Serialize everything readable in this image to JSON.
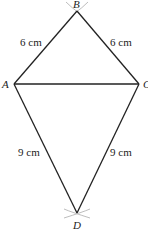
{
  "diagram": {
    "type": "kite construction",
    "colors": {
      "line": "#222222",
      "arc": "#b5b5b5",
      "text": "#222222",
      "background": "#ffffff"
    },
    "vertices": {
      "A": {
        "label": "A",
        "x": 14,
        "y": 84
      },
      "B": {
        "label": "B",
        "x": 77,
        "y": 11
      },
      "C": {
        "label": "C",
        "x": 139,
        "y": 84
      },
      "D": {
        "label": "D",
        "x": 77,
        "y": 213
      }
    },
    "edges": [
      {
        "from": "A",
        "to": "B",
        "length_label": "6 cm"
      },
      {
        "from": "B",
        "to": "C",
        "length_label": "6 cm"
      },
      {
        "from": "A",
        "to": "C",
        "length_label": ""
      },
      {
        "from": "A",
        "to": "D",
        "length_label": "9 cm"
      },
      {
        "from": "C",
        "to": "D",
        "length_label": "9 cm"
      }
    ],
    "labels": {
      "ab": "6 cm",
      "bc": "6 cm",
      "ad": "9 cm",
      "cd": "9 cm",
      "vertex_a": "A",
      "vertex_b": "B",
      "vertex_c": "C",
      "vertex_d": "D"
    },
    "construction_arcs": [
      "B",
      "D"
    ]
  }
}
